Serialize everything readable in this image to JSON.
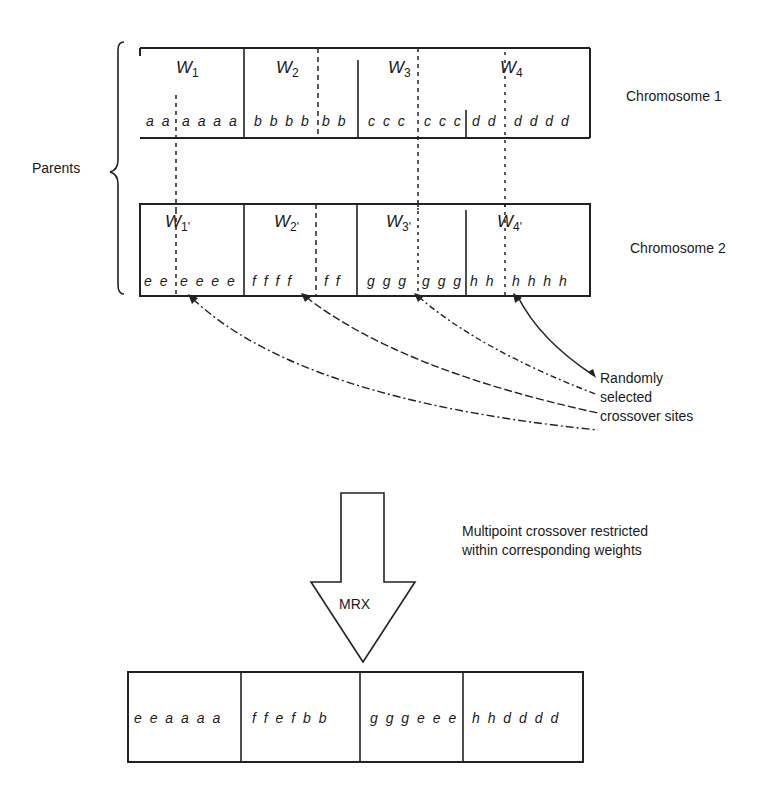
{
  "parents_label": "Parents",
  "chromosome1": {
    "label": "Chromosome 1",
    "weights": [
      "W",
      "W",
      "W",
      "W"
    ],
    "weight_subs": [
      "1",
      "2",
      "3",
      "4"
    ],
    "segments": [
      "aa",
      "aaaa",
      "bbbb",
      "bb",
      "ccc",
      "ccc",
      "dd",
      "dddd"
    ]
  },
  "chromosome2": {
    "label": "Chromosome 2",
    "weights": [
      "W",
      "W",
      "W",
      "W"
    ],
    "weight_subs": [
      "1'",
      "2'",
      "3'",
      "4'"
    ],
    "segments": [
      "ee",
      "eeee",
      "ffff",
      "ff",
      "ggg",
      "ggg",
      "hh",
      "hhhh"
    ]
  },
  "crossover_note": {
    "line1": "Randomly",
    "line2": "selected",
    "line3": "crossover sites"
  },
  "operator": {
    "label": "MRX",
    "description_line1": "Multipoint crossover restricted",
    "description_line2": "within corresponding weights"
  },
  "offspring": {
    "segments": [
      "eeaaaa",
      "ffefbb",
      "gggeee",
      "hhdddd"
    ]
  }
}
